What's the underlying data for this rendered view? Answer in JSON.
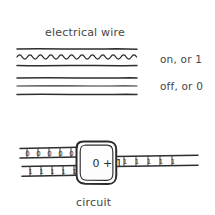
{
  "figure": {
    "title": "electrical wire",
    "caption": "circuit",
    "background_color": "#ffffff",
    "ink_color": "#2e2e2e",
    "text_color": "#454545"
  },
  "wires": [
    {
      "id": "wire-on",
      "state_label": "on, or 1",
      "style": "wavy",
      "description": "wire drawn with a wavy oscillating line between two straight rails"
    },
    {
      "id": "wire-off",
      "state_label": "off, or 0",
      "style": "straight",
      "description": "wire drawn with three plain straight lines"
    }
  ],
  "circuit": {
    "chip_label": "0 + 1",
    "inputs": [
      {
        "id": "input-top",
        "digits": [
          "0",
          "0",
          "0",
          "0",
          "0"
        ]
      },
      {
        "id": "input-bottom",
        "digits": [
          "1",
          "1",
          "1",
          "1",
          "1"
        ]
      }
    ],
    "outputs": [
      {
        "id": "output-right",
        "digits": [
          "1",
          "1",
          "1",
          "1",
          "1"
        ]
      }
    ]
  }
}
